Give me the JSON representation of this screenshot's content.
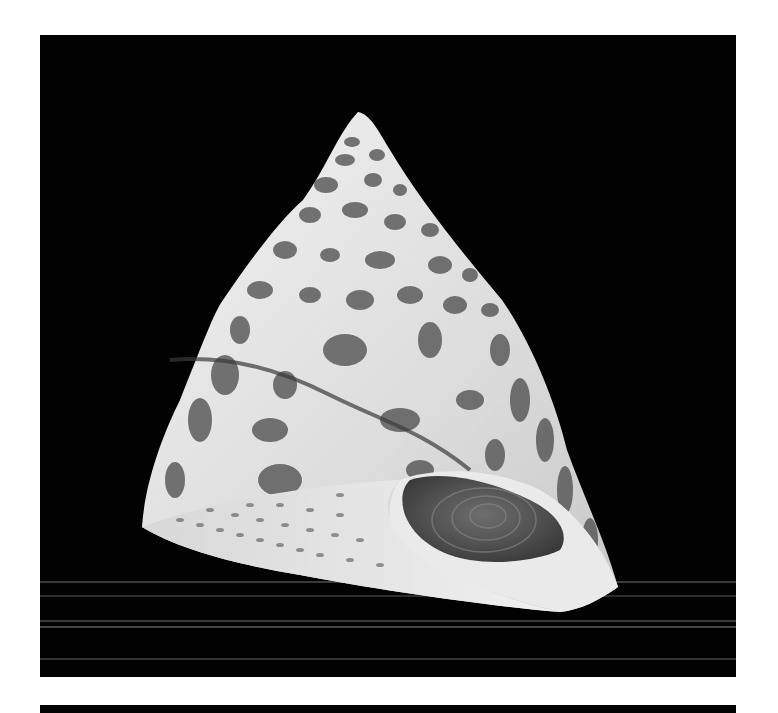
{
  "image": {
    "subject": "top snail shell (conical seashell) on black background",
    "background_color": "#020202",
    "page_color": "#ffffff",
    "shell_colors": {
      "light": "#e8e8e8",
      "mid": "#9a9a9a",
      "dark": "#3a3a3a",
      "operculum": "#5a5a5a"
    },
    "scanlines_y": [
      546,
      560,
      585,
      591,
      623
    ]
  }
}
